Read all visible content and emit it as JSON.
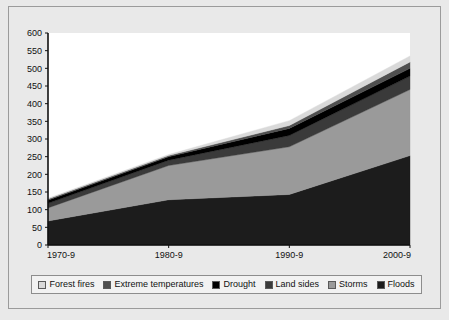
{
  "figure": {
    "background_color": "#e9e9e9",
    "frame_border_color": "#9b9b9b",
    "plot_background_color": "#ffffff",
    "axis_color": "#111111"
  },
  "legend": {
    "position": "bottom",
    "background_color": "#f2f2f2",
    "border_color": "#8d8d8d",
    "entries": [
      {
        "label": "Forest fires",
        "color": "#d9d9d9"
      },
      {
        "label": "Extreme temperatures",
        "color": "#4f4f4f"
      },
      {
        "label": "Drought",
        "color": "#000000"
      },
      {
        "label": "Land sides",
        "color": "#3a3a3a"
      },
      {
        "label": "Storms",
        "color": "#9a9a9a"
      },
      {
        "label": "Floods",
        "color": "#1c1c1c"
      }
    ]
  },
  "chart_data": {
    "type": "area",
    "stacked": true,
    "title": "",
    "xlabel": "",
    "ylabel": "",
    "categories": [
      "1970-9",
      "1980-9",
      "1990-9",
      "2000-9"
    ],
    "x_tick_labels": [
      "1970-9",
      "1980-9",
      "1990-9",
      "2000-9"
    ],
    "y_tick_labels": [
      "0",
      "50",
      "100",
      "150",
      "200",
      "250",
      "300",
      "350",
      "400",
      "450",
      "500",
      "550",
      "600"
    ],
    "y_ticks": [
      0,
      50,
      100,
      150,
      200,
      250,
      300,
      350,
      400,
      450,
      500,
      550,
      600
    ],
    "ylim": [
      0,
      600
    ],
    "grid": false,
    "legend_position": "bottom",
    "stack_order_bottom_to_top": [
      "Floods",
      "Storms",
      "Land sides",
      "Drought",
      "Extreme temperatures",
      "Forest fires"
    ],
    "series": [
      {
        "name": "Floods",
        "color": "#1c1c1c",
        "values": [
          68,
          128,
          143,
          253
        ]
      },
      {
        "name": "Storms",
        "color": "#9a9a9a",
        "values": [
          37,
          97,
          135,
          187
        ]
      },
      {
        "name": "Land sides",
        "color": "#3a3a3a",
        "values": [
          13,
          15,
          32,
          38
        ]
      },
      {
        "name": "Drought",
        "color": "#000000",
        "values": [
          9,
          10,
          20,
          22
        ]
      },
      {
        "name": "Extreme temperatures",
        "color": "#4f4f4f",
        "values": [
          3,
          3,
          8,
          18
        ]
      },
      {
        "name": "Forest fires",
        "color": "#d9d9d9",
        "values": [
          2,
          3,
          14,
          17
        ]
      }
    ],
    "cumulative_totals": {
      "Floods": [
        68,
        128,
        143,
        253
      ],
      "Storms": [
        105,
        225,
        278,
        440
      ],
      "Land sides": [
        118,
        240,
        310,
        478
      ],
      "Drought": [
        127,
        250,
        330,
        500
      ],
      "Extreme temperatures": [
        130,
        253,
        338,
        518
      ],
      "Forest fires": [
        132,
        256,
        352,
        535
      ]
    },
    "totals": [
      132,
      256,
      352,
      535
    ]
  }
}
